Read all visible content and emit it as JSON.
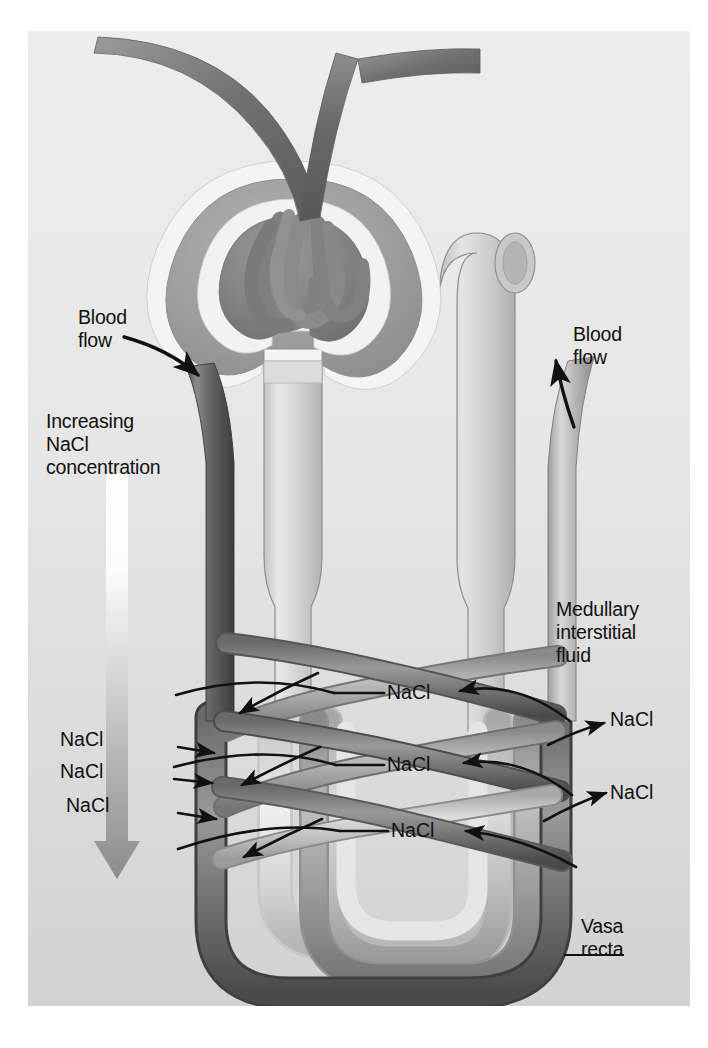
{
  "figure": {
    "type": "anatomical-diagram",
    "background_color": "#e8e8e8",
    "panel": {
      "left": 28,
      "top": 31,
      "width": 662,
      "height": 975
    }
  },
  "labels": {
    "blood_flow_left": "Blood\nflow",
    "blood_flow_right": "Blood\nflow",
    "gradient": "Increasing\nNaCl\nconcentration",
    "medullary": "Medullary\ninterstitial\nfluid",
    "vasa_recta": "Vasa\nrecta",
    "nacl": "NaCl"
  },
  "nacl_labels": {
    "left": [
      "NaCl",
      "NaCl",
      "NaCl"
    ],
    "center": [
      "NaCl",
      "NaCl",
      "NaCl"
    ],
    "right": [
      "NaCl",
      "NaCl"
    ]
  },
  "gradient_arrow": {
    "name": "increasing-nacl-gradient-arrow",
    "direction": "down",
    "top_color": "#ffffff",
    "bottom_color": "#8a8a8a"
  },
  "colors": {
    "panel_bg_top": "#eaeaea",
    "panel_bg_bottom": "#d2d2d2",
    "descending_vessel_dark": "#6f6f6f",
    "ascending_vessel_light": "#b9b9b9",
    "tubule_light": "#d8d8d8",
    "glomerulus_dark": "#8d8d8d",
    "capsule_white": "#f5f5f5",
    "stroke": "#111111"
  },
  "structures": {
    "glomerulus": "glomerular capillary tuft",
    "bowmans_capsule": "Bowman's capsule",
    "afferent_arteriole": "afferent arteriole",
    "efferent_arteriole": "efferent arteriole",
    "descending_limb": "descending limb of loop of Henle",
    "ascending_limb": "ascending limb of loop of Henle",
    "descending_vasa_recta": "descending vasa recta",
    "ascending_vasa_recta": "ascending vasa recta"
  }
}
